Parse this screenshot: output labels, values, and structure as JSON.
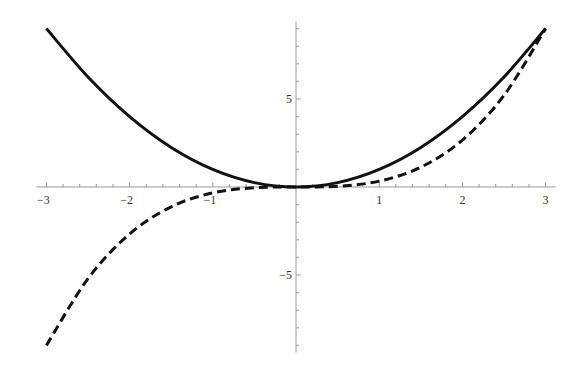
{
  "chart_data": {
    "type": "line",
    "title": "",
    "xlabel": "",
    "ylabel": "",
    "xlim": [
      -3,
      3
    ],
    "ylim": [
      -9.4,
      9.4
    ],
    "grid": false,
    "legend": "none",
    "x_ticks": [
      {
        "value": -3,
        "label": "−3"
      },
      {
        "value": -2,
        "label": "−2"
      },
      {
        "value": -1,
        "label": "−1"
      },
      {
        "value": 1,
        "label": "1"
      },
      {
        "value": 2,
        "label": "2"
      },
      {
        "value": 3,
        "label": "3"
      }
    ],
    "y_ticks": [
      {
        "value": 5,
        "label": "5"
      },
      {
        "value": -5,
        "label": "−5"
      }
    ],
    "x_minor_step": 0.2,
    "y_minor_step": 1,
    "series": [
      {
        "name": "x^2",
        "style": "solid",
        "color": "#111111",
        "x": [
          -3,
          -2.5,
          -2,
          -1.5,
          -1,
          -0.5,
          0,
          0.5,
          1,
          1.5,
          2,
          2.5,
          3
        ],
        "values": [
          9,
          6.25,
          4,
          2.25,
          1,
          0.25,
          0,
          0.25,
          1,
          2.25,
          4,
          6.25,
          9
        ]
      },
      {
        "name": "x^3/3",
        "style": "dashed",
        "color": "#111111",
        "x": [
          -3,
          -2.5,
          -2,
          -1.5,
          -1,
          -0.5,
          0,
          0.5,
          1,
          1.5,
          2,
          2.5,
          3
        ],
        "values": [
          -9,
          -5.208,
          -2.667,
          -1.125,
          -0.333,
          -0.042,
          0,
          0.042,
          0.333,
          1.125,
          2.667,
          5.208,
          9
        ]
      }
    ]
  }
}
